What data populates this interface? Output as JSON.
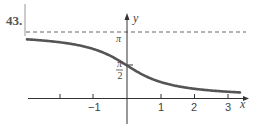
{
  "problem": {
    "number": "43."
  },
  "chart_data": {
    "type": "line",
    "title": "",
    "function": "y = π/2 − arctan(x)",
    "xlabel": "x",
    "ylabel": "y",
    "x_ticks": [
      -2,
      -1,
      1,
      2,
      3
    ],
    "x_tick_labels": [
      "",
      "−1",
      "1",
      "2",
      "3"
    ],
    "y_tick_labels": [
      "π/2",
      "π"
    ],
    "y_ticks": [
      1.5708,
      3.1416
    ],
    "asymptotes": [
      {
        "y": 3.1416,
        "style": "dashed"
      },
      {
        "y": 0,
        "style": "axis"
      }
    ],
    "xlim": [
      -3,
      3.6
    ],
    "ylim": [
      0,
      3.1416
    ],
    "series": [
      {
        "name": "curve",
        "x": [
          -3,
          -2,
          -1,
          0,
          1,
          2,
          3
        ],
        "values": [
          2.82,
          2.68,
          2.36,
          1.57,
          0.79,
          0.46,
          0.32
        ]
      }
    ],
    "grid": false,
    "legend": "none"
  },
  "labels": {
    "x_axis": "x",
    "y_axis": "y",
    "pi": "π",
    "pi_num": "π",
    "pi_den": "2",
    "tick_neg1": "−1",
    "tick_1": "1",
    "tick_2": "2",
    "tick_3": "3"
  }
}
